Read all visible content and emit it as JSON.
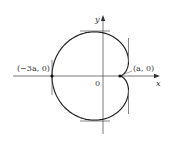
{
  "diagram": {
    "type": "cardioid-parametric-curve",
    "curve_equation": "x = a(2cos t - cos 2t), y = a(2sin t - sin 2t)",
    "axes": {
      "x_label": "x",
      "y_label": "y",
      "origin_label": "0"
    },
    "points": [
      {
        "label": "(−3a, 0)",
        "x": -3,
        "y": 0
      },
      {
        "label": "(a, 0)",
        "x": 1,
        "y": 0
      }
    ],
    "tangent_lines": [
      {
        "kind": "horizontal",
        "where": "top"
      },
      {
        "kind": "horizontal",
        "where": "bottom"
      },
      {
        "kind": "vertical",
        "where": "left at (−3a, 0)"
      },
      {
        "kind": "vertical",
        "where": "right upper"
      },
      {
        "kind": "vertical",
        "where": "right lower"
      }
    ],
    "colors": {
      "curve": "#222222",
      "axes": "#555555",
      "tangent": "#555555"
    }
  }
}
